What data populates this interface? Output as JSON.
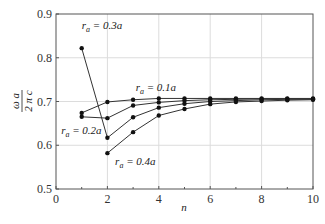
{
  "chart_data": {
    "type": "line",
    "title": "",
    "xlabel": "n",
    "ylabel": "ωa / 2πc",
    "xlim": [
      0,
      10
    ],
    "ylim": [
      0.5,
      0.9
    ],
    "xticks": [
      0,
      2,
      4,
      6,
      8,
      10
    ],
    "yticks": [
      0.5,
      0.6,
      0.7,
      0.8,
      0.9
    ],
    "grid": true,
    "legend": "none (inline annotations)",
    "series": [
      {
        "name": "r_a = 0.1a",
        "label_main": "r",
        "label_sub": "a",
        "label_rest": " = 0.1a",
        "x": [
          1,
          2,
          3,
          4,
          5,
          6,
          7,
          8,
          9,
          10
        ],
        "y": [
          0.674,
          0.699,
          0.704,
          0.707,
          0.707,
          0.707,
          0.707,
          0.707,
          0.707,
          0.707
        ]
      },
      {
        "name": "r_a = 0.2a",
        "label_main": "r",
        "label_sub": "a",
        "label_rest": " = 0.2a",
        "x": [
          1,
          2,
          3,
          4,
          5,
          6,
          7,
          8,
          9,
          10
        ],
        "y": [
          0.665,
          0.662,
          0.691,
          0.698,
          0.702,
          0.704,
          0.705,
          0.706,
          0.706,
          0.706
        ]
      },
      {
        "name": "r_a = 0.3a",
        "label_main": "r",
        "label_sub": "a",
        "label_rest": " = 0.3a",
        "x": [
          1,
          2,
          3,
          4,
          5,
          6,
          7,
          8,
          9,
          10
        ],
        "y": [
          0.822,
          0.617,
          0.664,
          0.686,
          0.695,
          0.7,
          0.702,
          0.704,
          0.705,
          0.705
        ]
      },
      {
        "name": "r_a = 0.4a",
        "label_main": "r",
        "label_sub": "a",
        "label_rest": " = 0.4a",
        "x": [
          2,
          3,
          4,
          5,
          6,
          7,
          8,
          9,
          10
        ],
        "y": [
          0.582,
          0.63,
          0.668,
          0.683,
          0.694,
          0.699,
          0.701,
          0.703,
          0.704
        ]
      }
    ],
    "annotations": [
      {
        "series": 2,
        "text": "r_a = 0.3a",
        "x": 1.0,
        "y": 0.865
      },
      {
        "series": 0,
        "text": "r_a = 0.1a",
        "x": 3.1,
        "y": 0.725
      },
      {
        "series": 1,
        "text": "r_a = 0.2a",
        "x": 0.2,
        "y": 0.625
      },
      {
        "series": 3,
        "text": "r_a = 0.4a",
        "x": 2.3,
        "y": 0.555
      }
    ]
  }
}
